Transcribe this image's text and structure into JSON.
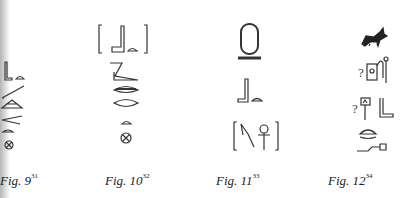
{
  "figures": [
    {
      "label": "Fig. 9",
      "footnote": "31",
      "glyphs": [
        "seated-man-ground-sign",
        "slope-sign",
        "eye-sign",
        "mouth-sign",
        "bread-loaf-sign",
        "placenta-sign"
      ]
    },
    {
      "label": "Fig. 10",
      "footnote": "32",
      "glyphs": [
        "bracketed-seated-man-ground",
        "slope-sign",
        "eye-sign",
        "mouth-sign",
        "bread-loaf-sign",
        "placenta-sign"
      ]
    },
    {
      "label": "Fig. 11",
      "footnote": "33",
      "glyphs": [
        "cartouche",
        "seated-man-ground-sign",
        "bracketed-tool-and-ankh"
      ]
    },
    {
      "label": "Fig. 12",
      "footnote": "34",
      "glyphs": [
        "jackal-sign",
        "uncertain-shrine-sign",
        "uncertain-column-and-leg",
        "basket-sign",
        "bolt-sign"
      ],
      "uncertain_mark": "?"
    }
  ]
}
